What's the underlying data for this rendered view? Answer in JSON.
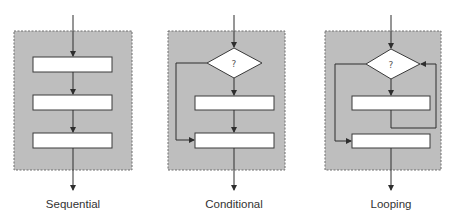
{
  "diagrams": [
    {
      "id": "sequential",
      "label": "Sequential"
    },
    {
      "id": "conditional",
      "label": "Conditional",
      "decision_symbol": "?"
    },
    {
      "id": "looping",
      "label": "Looping",
      "decision_symbol": "?"
    }
  ],
  "colors": {
    "panel_fill": "#bebebe",
    "panel_border": "#6f6f6f",
    "line": "#2e2e2e",
    "box_fill": "#ffffff"
  }
}
